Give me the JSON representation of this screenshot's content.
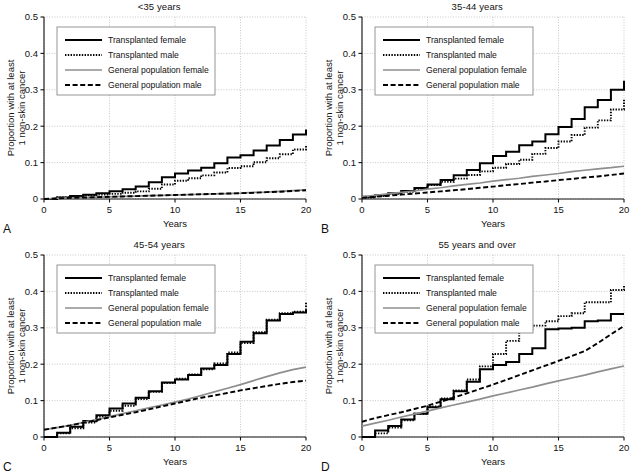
{
  "figure": {
    "y_axis_label_line1": "Proportion with at least",
    "y_axis_label_line2": "1 non-skin cancer",
    "x_axis_label": "Years",
    "y_ticks": [
      "0",
      "0.1",
      "0.2",
      "0.3",
      "0.4",
      "0.5"
    ],
    "x_ticks": [
      "0",
      "5",
      "10",
      "15",
      "20"
    ],
    "legend": [
      {
        "key": "transplanted_female",
        "label": "Transplanted female",
        "style": "solid-black",
        "color": "#000000"
      },
      {
        "key": "transplanted_male",
        "label": "Transplanted male",
        "style": "dotted-black",
        "color": "#000000"
      },
      {
        "key": "general_population_female",
        "label": "General population female",
        "style": "solid-gray",
        "color": "#8e8e8e"
      },
      {
        "key": "general_population_male",
        "label": "General population male",
        "style": "dashed-black",
        "color": "#000000"
      }
    ],
    "panels": [
      {
        "letter": "A",
        "title": "<35 years"
      },
      {
        "letter": "B",
        "title": "35-44 years"
      },
      {
        "letter": "C",
        "title": "45-54 years"
      },
      {
        "letter": "D",
        "title": "55 years and over"
      }
    ]
  },
  "chart_data": [
    {
      "panel": "A",
      "type": "line",
      "title": "<35 years",
      "xlabel": "Years",
      "ylabel": "Proportion with at least 1 non-skin cancer",
      "xlim": [
        0,
        20
      ],
      "ylim": [
        0,
        0.5
      ],
      "grid": true,
      "legend_position": "upper-left",
      "x": [
        0,
        1,
        2,
        3,
        4,
        5,
        6,
        7,
        8,
        9,
        10,
        11,
        12,
        13,
        14,
        15,
        16,
        17,
        18,
        19,
        20
      ],
      "series": [
        {
          "name": "Transplanted female",
          "values": [
            0.0,
            0.004,
            0.008,
            0.012,
            0.016,
            0.021,
            0.027,
            0.034,
            0.046,
            0.06,
            0.07,
            0.078,
            0.086,
            0.098,
            0.114,
            0.12,
            0.133,
            0.147,
            0.162,
            0.177,
            0.191
          ]
        },
        {
          "name": "Transplanted male",
          "values": [
            0.0,
            0.004,
            0.008,
            0.01,
            0.012,
            0.014,
            0.017,
            0.021,
            0.028,
            0.04,
            0.05,
            0.057,
            0.065,
            0.073,
            0.085,
            0.09,
            0.101,
            0.112,
            0.123,
            0.136,
            0.148
          ]
        },
        {
          "name": "General population female",
          "values": [
            0.0,
            0.002,
            0.003,
            0.004,
            0.005,
            0.006,
            0.007,
            0.008,
            0.009,
            0.01,
            0.011,
            0.012,
            0.013,
            0.014,
            0.015,
            0.016,
            0.018,
            0.019,
            0.021,
            0.023,
            0.025
          ]
        },
        {
          "name": "General population male",
          "values": [
            0.0,
            0.002,
            0.003,
            0.004,
            0.005,
            0.006,
            0.007,
            0.008,
            0.009,
            0.01,
            0.011,
            0.012,
            0.013,
            0.014,
            0.015,
            0.016,
            0.017,
            0.019,
            0.02,
            0.022,
            0.024
          ]
        }
      ]
    },
    {
      "panel": "B",
      "type": "line",
      "title": "35-44 years",
      "xlabel": "Years",
      "ylabel": "Proportion with at least 1 non-skin cancer",
      "xlim": [
        0,
        20
      ],
      "ylim": [
        0,
        0.5
      ],
      "grid": true,
      "legend_position": "upper-left",
      "x": [
        0,
        1,
        2,
        3,
        4,
        5,
        6,
        7,
        8,
        9,
        10,
        11,
        12,
        13,
        14,
        15,
        16,
        17,
        18,
        19,
        20
      ],
      "series": [
        {
          "name": "Transplanted female",
          "values": [
            0.006,
            0.01,
            0.016,
            0.022,
            0.03,
            0.04,
            0.052,
            0.065,
            0.08,
            0.098,
            0.118,
            0.13,
            0.148,
            0.158,
            0.178,
            0.198,
            0.22,
            0.252,
            0.272,
            0.3,
            0.325
          ]
        },
        {
          "name": "Transplanted male",
          "values": [
            0.004,
            0.008,
            0.014,
            0.02,
            0.028,
            0.038,
            0.047,
            0.056,
            0.066,
            0.076,
            0.086,
            0.096,
            0.108,
            0.124,
            0.14,
            0.158,
            0.176,
            0.196,
            0.216,
            0.246,
            0.275
          ]
        },
        {
          "name": "General population female",
          "values": [
            0.006,
            0.01,
            0.014,
            0.018,
            0.022,
            0.027,
            0.031,
            0.036,
            0.04,
            0.044,
            0.049,
            0.053,
            0.057,
            0.062,
            0.066,
            0.07,
            0.075,
            0.079,
            0.083,
            0.086,
            0.09
          ]
        },
        {
          "name": "General population male",
          "values": [
            0.003,
            0.006,
            0.009,
            0.012,
            0.015,
            0.018,
            0.021,
            0.024,
            0.027,
            0.031,
            0.034,
            0.038,
            0.041,
            0.045,
            0.048,
            0.052,
            0.055,
            0.059,
            0.062,
            0.066,
            0.07
          ]
        }
      ]
    },
    {
      "panel": "C",
      "type": "line",
      "title": "45-54 years",
      "xlabel": "Years",
      "ylabel": "Proportion with at least 1 non-skin cancer",
      "xlim": [
        0,
        20
      ],
      "ylim": [
        0,
        0.5
      ],
      "grid": true,
      "legend_position": "upper-left",
      "x": [
        0,
        1,
        2,
        3,
        4,
        5,
        6,
        7,
        8,
        9,
        10,
        11,
        12,
        13,
        14,
        15,
        16,
        17,
        18,
        19,
        20
      ],
      "series": [
        {
          "name": "Transplanted female",
          "values": [
            0.0,
            0.012,
            0.028,
            0.044,
            0.06,
            0.078,
            0.092,
            0.108,
            0.126,
            0.15,
            0.158,
            0.17,
            0.188,
            0.198,
            0.228,
            0.262,
            0.285,
            0.32,
            0.338,
            0.342,
            0.35
          ]
        },
        {
          "name": "Transplanted male",
          "values": [
            0.0,
            0.01,
            0.024,
            0.04,
            0.056,
            0.072,
            0.086,
            0.104,
            0.124,
            0.148,
            0.16,
            0.172,
            0.186,
            0.202,
            0.232,
            0.258,
            0.288,
            0.322,
            0.34,
            0.344,
            0.372
          ]
        },
        {
          "name": "General population female",
          "values": [
            0.02,
            0.026,
            0.032,
            0.04,
            0.048,
            0.056,
            0.064,
            0.072,
            0.08,
            0.088,
            0.096,
            0.104,
            0.114,
            0.124,
            0.134,
            0.144,
            0.155,
            0.166,
            0.176,
            0.185,
            0.192
          ]
        },
        {
          "name": "General population male",
          "values": [
            0.02,
            0.026,
            0.032,
            0.039,
            0.046,
            0.054,
            0.061,
            0.068,
            0.076,
            0.084,
            0.092,
            0.1,
            0.108,
            0.114,
            0.121,
            0.128,
            0.134,
            0.14,
            0.146,
            0.151,
            0.155
          ]
        }
      ]
    },
    {
      "panel": "D",
      "type": "line",
      "title": "55 years and over",
      "xlabel": "Years",
      "ylabel": "Proportion with at least 1 non-skin cancer",
      "xlim": [
        0,
        20
      ],
      "ylim": [
        0,
        0.5
      ],
      "grid": true,
      "legend_position": "upper-left",
      "x": [
        0,
        1,
        2,
        3,
        4,
        5,
        6,
        7,
        8,
        9,
        10,
        11,
        12,
        13,
        14,
        15,
        16,
        17,
        18,
        19,
        20
      ],
      "series": [
        {
          "name": "Transplanted female",
          "values": [
            0.0,
            0.018,
            0.03,
            0.048,
            0.064,
            0.082,
            0.104,
            0.126,
            0.152,
            0.186,
            0.198,
            0.206,
            0.228,
            0.244,
            0.296,
            0.298,
            0.3,
            0.318,
            0.32,
            0.338,
            0.338
          ]
        },
        {
          "name": "Transplanted male",
          "values": [
            0.0,
            0.01,
            0.026,
            0.046,
            0.064,
            0.084,
            0.106,
            0.128,
            0.158,
            0.194,
            0.228,
            0.264,
            0.296,
            0.306,
            0.318,
            0.332,
            0.34,
            0.37,
            0.37,
            0.404,
            0.416
          ]
        },
        {
          "name": "General population female",
          "values": [
            0.03,
            0.038,
            0.046,
            0.055,
            0.063,
            0.071,
            0.08,
            0.088,
            0.096,
            0.104,
            0.113,
            0.121,
            0.129,
            0.137,
            0.146,
            0.154,
            0.162,
            0.17,
            0.179,
            0.187,
            0.195
          ]
        },
        {
          "name": "General population male",
          "values": [
            0.042,
            0.052,
            0.06,
            0.068,
            0.077,
            0.086,
            0.097,
            0.108,
            0.12,
            0.132,
            0.144,
            0.157,
            0.17,
            0.183,
            0.196,
            0.209,
            0.222,
            0.236,
            0.258,
            0.282,
            0.305
          ]
        }
      ]
    }
  ]
}
